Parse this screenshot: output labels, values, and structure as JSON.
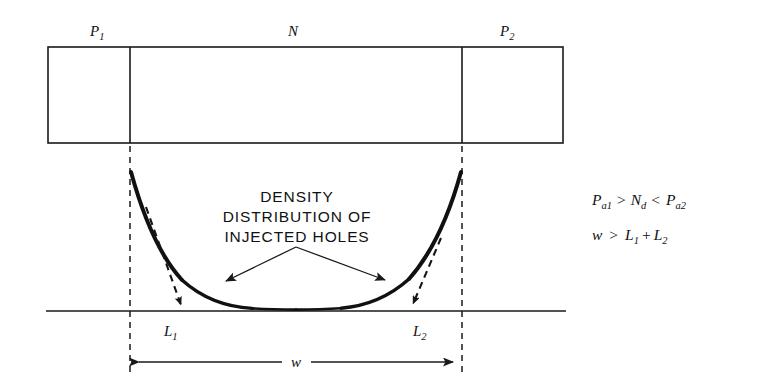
{
  "figure": {
    "background_color": "#ffffff",
    "ink_color": "#111111"
  },
  "structure": {
    "region_labels": [
      {
        "id": "p1",
        "base": "P",
        "sub": "1",
        "x": 97,
        "y": 33
      },
      {
        "id": "n",
        "base": "N",
        "sub": "",
        "x": 293,
        "y": 33
      },
      {
        "id": "p2",
        "base": "P",
        "sub": "2",
        "x": 507,
        "y": 33
      }
    ],
    "box": {
      "left": 48,
      "top": 47,
      "right": 563,
      "bottom": 143
    },
    "dividers": [
      {
        "id": "p1-n-junction",
        "x": 130
      },
      {
        "id": "n-p2-junction",
        "x": 462
      }
    ]
  },
  "plot": {
    "baseline": {
      "x1": 46,
      "x2": 566,
      "y": 311
    },
    "guides": [
      {
        "id": "left-guide",
        "x": 130,
        "y1": 143,
        "y2": 375
      },
      {
        "id": "right-guide",
        "x": 462,
        "y1": 143,
        "y2": 375
      }
    ],
    "curve": {
      "id": "density-distribution-curve",
      "shape": "catenary",
      "left_x": 131,
      "right_x": 461,
      "top_y": 172,
      "bottom_y": 308,
      "stroke_width_max": 4.0,
      "stroke_width_min": 2.2
    },
    "tangents": [
      {
        "id": "left-tangent",
        "x1": 146,
        "y1": 207,
        "x2": 181,
        "y2": 309
      },
      {
        "id": "right-tangent",
        "x1": 441,
        "y1": 238,
        "x2": 412,
        "y2": 308
      }
    ],
    "intercept_labels": [
      {
        "id": "l1",
        "base": "L",
        "sub": "1",
        "x": 170,
        "y": 334
      },
      {
        "id": "l2",
        "base": "L",
        "sub": "2",
        "x": 419,
        "y": 334
      }
    ]
  },
  "callout": {
    "lines": [
      "DENSITY",
      "DISTRIBUTION OF",
      "INJECTED HOLES"
    ],
    "line_y": [
      202,
      222,
      242
    ],
    "center_x": 297,
    "apex": {
      "x": 296,
      "y": 246
    },
    "arrows": [
      {
        "id": "callout-arrow-left",
        "x": 220,
        "y": 285
      },
      {
        "id": "callout-arrow-right",
        "x": 391,
        "y": 284
      }
    ]
  },
  "dimension": {
    "id": "width-dimension",
    "label": "w",
    "label_x": 296,
    "label_y": 367,
    "y": 362,
    "x1": 131,
    "x2": 461
  },
  "equations": [
    {
      "id": "equation-carrier-density",
      "y": 205,
      "tokens": [
        {
          "type": "var",
          "text": "P",
          "sub": "a1"
        },
        {
          "type": "op",
          "text": ">"
        },
        {
          "type": "var",
          "text": "N",
          "sub": "d"
        },
        {
          "type": "op",
          "text": "<"
        },
        {
          "type": "var",
          "text": "P",
          "sub": "a2"
        }
      ],
      "plain": "Pa1 > Nd < Pa2"
    },
    {
      "id": "equation-width",
      "y": 240,
      "tokens": [
        {
          "type": "var",
          "text": "w",
          "sub": ""
        },
        {
          "type": "op",
          "text": ">"
        },
        {
          "type": "var",
          "text": "L",
          "sub": "1"
        },
        {
          "type": "op",
          "text": "+"
        },
        {
          "type": "var",
          "text": "L",
          "sub": "2"
        }
      ],
      "plain": "w > L1 + L2"
    }
  ]
}
